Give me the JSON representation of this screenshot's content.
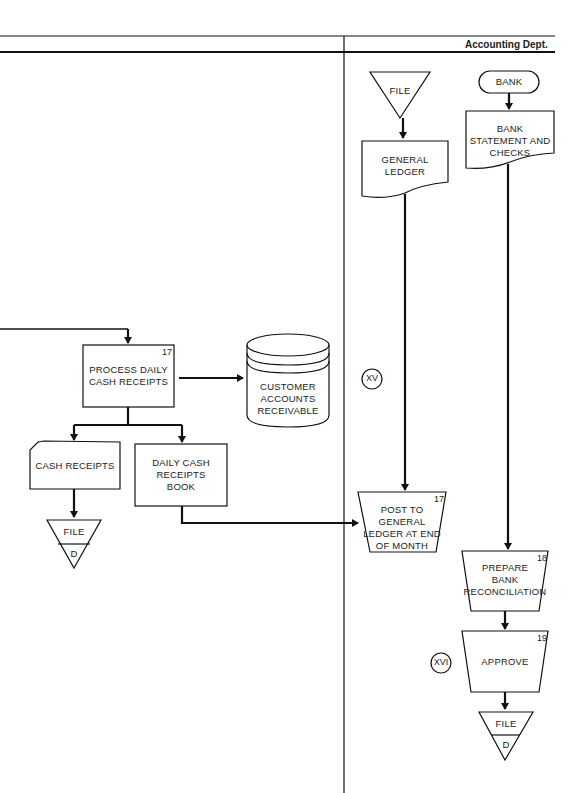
{
  "header": {
    "department": "Accounting Dept."
  },
  "nodes": {
    "file_top": {
      "label": "FILE"
    },
    "bank": {
      "label": "BANK"
    },
    "general_ledger": {
      "label": "GENERAL\nLEDGER"
    },
    "bank_statement": {
      "label": "BANK\nSTATEMENT AND\nCHECKS"
    },
    "process_daily": {
      "label": "PROCESS DAILY\nCASH RECEIPTS",
      "step": "17"
    },
    "customer_ar": {
      "label": "CUSTOMER\nACCOUNTS\nRECEIVABLE"
    },
    "cash_receipts": {
      "label": "CASH RECEIPTS"
    },
    "daily_book": {
      "label": "DAILY CASH\nRECEIPTS\nBOOK"
    },
    "file_left": {
      "label": "FILE",
      "sub": "D"
    },
    "post_gl": {
      "label": "POST TO GENERAL\nLEDGER AT END\nOF MONTH",
      "step": "17"
    },
    "prepare_recon": {
      "label": "PREPARE\nBANK\nRECONCILIATION",
      "step": "18"
    },
    "approve": {
      "label": "APPROVE",
      "step": "19"
    },
    "file_bottom": {
      "label": "FILE",
      "sub": "D"
    }
  },
  "connectors": {
    "xv": "XV",
    "xvi": "XVI"
  }
}
